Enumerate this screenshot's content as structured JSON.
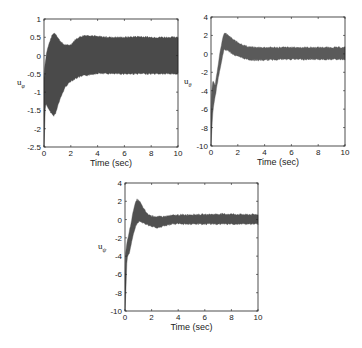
{
  "chart_data": [
    {
      "type": "area",
      "title": "",
      "xlabel": "Time (sec)",
      "ylabel": "u",
      "ylabel_sub": "φ",
      "xlim": [
        0,
        10
      ],
      "ylim": [
        -2.5,
        1
      ],
      "xticks": [
        0,
        2,
        4,
        6,
        8,
        10
      ],
      "yticks": [
        -2.5,
        -2,
        -1.5,
        -1,
        -0.5,
        0,
        0.5,
        1
      ],
      "ytick_labels": [
        "-2.5",
        "-2",
        "-1.5",
        "-1",
        "-0.5",
        "0",
        "0.5",
        "1"
      ],
      "grid": false,
      "fill_color": "#4a4a4a",
      "series": [
        {
          "name": "upper envelope",
          "x": [
            0,
            0.05,
            0.2,
            0.4,
            0.6,
            0.75,
            0.9,
            1.1,
            1.4,
            1.7,
            2.0,
            2.3,
            2.6,
            3.0,
            3.5,
            4.0,
            5.0,
            6.0,
            7.0,
            8.0,
            9.0,
            10.0
          ],
          "values": [
            -0.6,
            -0.3,
            0.1,
            0.35,
            0.55,
            0.62,
            0.58,
            0.45,
            0.32,
            0.28,
            0.3,
            0.42,
            0.5,
            0.55,
            0.55,
            0.52,
            0.5,
            0.5,
            0.52,
            0.5,
            0.5,
            0.5
          ]
        },
        {
          "name": "lower envelope",
          "x": [
            0,
            0.03,
            0.08,
            0.15,
            0.3,
            0.5,
            0.7,
            0.85,
            1.0,
            1.3,
            1.6,
            2.0,
            2.5,
            3.0,
            3.5,
            4.0,
            5.0,
            6.0,
            7.0,
            8.0,
            9.0,
            10.0
          ],
          "values": [
            -2.5,
            -2.3,
            -1.5,
            -1.3,
            -1.45,
            -1.55,
            -1.65,
            -1.6,
            -1.4,
            -1.1,
            -0.85,
            -0.7,
            -0.6,
            -0.55,
            -0.52,
            -0.48,
            -0.5,
            -0.5,
            -0.5,
            -0.5,
            -0.5,
            -0.5
          ]
        }
      ]
    },
    {
      "type": "area",
      "title": "",
      "xlabel": "Time (sec)",
      "ylabel": "u",
      "ylabel_sub": "θ",
      "xlim": [
        0,
        10
      ],
      "ylim": [
        -10,
        4
      ],
      "xticks": [
        0,
        2,
        4,
        6,
        8,
        10
      ],
      "yticks": [
        -10,
        -8,
        -6,
        -4,
        -2,
        0,
        2,
        4
      ],
      "ytick_labels": [
        "-10",
        "-8",
        "-6",
        "-4",
        "-2",
        "0",
        "2",
        "4"
      ],
      "grid": false,
      "fill_color": "#5a5a5a",
      "series": [
        {
          "name": "upper envelope",
          "x": [
            0,
            0.05,
            0.15,
            0.3,
            0.5,
            0.7,
            0.9,
            1.0,
            1.3,
            1.7,
            2.2,
            2.7,
            3.2,
            4.0,
            5.0,
            6.0,
            7.0,
            8.0,
            9.0,
            10.0
          ],
          "values": [
            -6.5,
            -4.0,
            -2.8,
            -3.5,
            -1.5,
            0.5,
            1.8,
            2.3,
            2.0,
            1.5,
            1.1,
            0.8,
            0.7,
            0.7,
            0.7,
            0.7,
            0.7,
            0.7,
            0.7,
            0.7
          ]
        },
        {
          "name": "lower envelope",
          "x": [
            0,
            0.05,
            0.15,
            0.3,
            0.5,
            0.7,
            0.9,
            1.0,
            1.3,
            1.7,
            2.2,
            2.7,
            3.2,
            4.0,
            5.0,
            6.0,
            7.0,
            8.0,
            9.0,
            10.0
          ],
          "values": [
            -10,
            -8.5,
            -6.0,
            -4.8,
            -3.0,
            -1.5,
            0.0,
            0.5,
            0.3,
            -0.1,
            -0.4,
            -0.6,
            -0.7,
            -0.7,
            -0.6,
            -0.6,
            -0.6,
            -0.6,
            -0.6,
            -0.6
          ]
        }
      ]
    },
    {
      "type": "area",
      "title": "",
      "xlabel": "Time (sec)",
      "ylabel": "u",
      "ylabel_sub": "ψ",
      "xlim": [
        0,
        10
      ],
      "ylim": [
        -10,
        4
      ],
      "xticks": [
        0,
        2,
        4,
        6,
        8,
        10
      ],
      "yticks": [
        -10,
        -8,
        -6,
        -4,
        -2,
        0,
        2,
        4
      ],
      "ytick_labels": [
        "-10",
        "-8",
        "-6",
        "-4",
        "-2",
        "0",
        "2",
        "4"
      ],
      "grid": false,
      "fill_color": "#505050",
      "series": [
        {
          "name": "upper envelope",
          "x": [
            0,
            0.05,
            0.15,
            0.3,
            0.5,
            0.7,
            0.9,
            1.1,
            1.4,
            1.7,
            2.0,
            2.5,
            3.0,
            3.5,
            4.0,
            5.0,
            6.0,
            7.0,
            8.0,
            9.0,
            10.0
          ],
          "values": [
            -6.0,
            -3.5,
            -2.5,
            -1.5,
            0.0,
            1.5,
            2.2,
            2.0,
            1.2,
            0.6,
            0.4,
            0.3,
            0.35,
            0.45,
            0.5,
            0.55,
            0.55,
            0.6,
            0.6,
            0.55,
            0.55
          ]
        },
        {
          "name": "lower envelope",
          "x": [
            0,
            0.05,
            0.15,
            0.3,
            0.5,
            0.7,
            0.9,
            1.1,
            1.4,
            1.7,
            2.0,
            2.5,
            3.0,
            3.5,
            4.0,
            5.0,
            6.0,
            7.0,
            8.0,
            9.0,
            10.0
          ],
          "values": [
            -10,
            -8.5,
            -4.2,
            -3.8,
            -2.5,
            -1.2,
            -0.4,
            -0.2,
            -0.4,
            -0.6,
            -0.8,
            -0.9,
            -0.7,
            -0.5,
            -0.45,
            -0.5,
            -0.5,
            -0.5,
            -0.5,
            -0.5,
            -0.5
          ]
        }
      ]
    }
  ]
}
